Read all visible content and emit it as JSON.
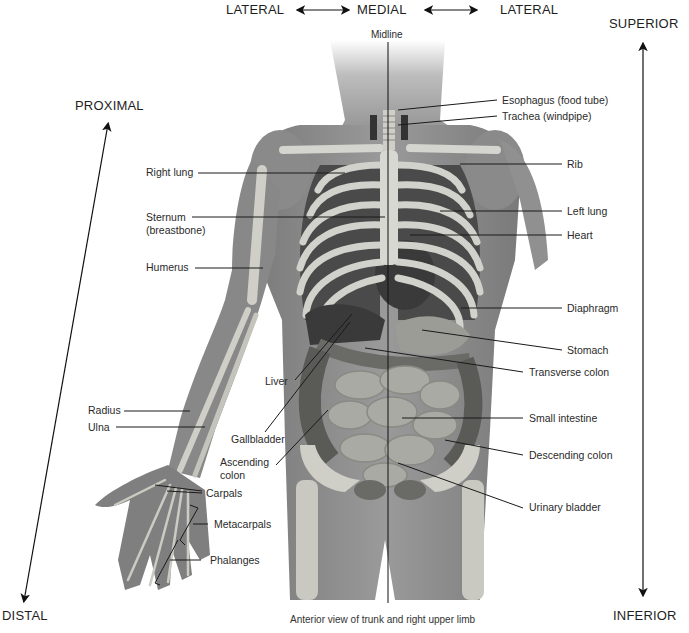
{
  "figure": {
    "caption": "Anterior view of trunk and right upper limb",
    "midline_label": "Midline",
    "colors": {
      "background": "#ffffff",
      "skin": "#8c8c8c",
      "skin_dark": "#6e6e6e",
      "bone": "#d2d2cc",
      "organ_dark": "#3f3f3f",
      "intestine": "#a9a9a4",
      "leader_line": "#1a1a1a"
    }
  },
  "directions": {
    "top_left": "LATERAL",
    "top_center": "MEDIAL",
    "top_right": "LATERAL",
    "superior": "SUPERIOR",
    "inferior": "INFERIOR",
    "proximal": "PROXIMAL",
    "distal": "DISTAL"
  },
  "labels": {
    "left": [
      {
        "id": "right-lung",
        "text": "Right lung"
      },
      {
        "id": "sternum",
        "text": "Sternum"
      },
      {
        "id": "sternum-sub",
        "text": "(breastbone)"
      },
      {
        "id": "humerus",
        "text": "Humerus"
      },
      {
        "id": "liver",
        "text": "Liver"
      },
      {
        "id": "radius",
        "text": "Radius"
      },
      {
        "id": "ulna",
        "text": "Ulna"
      },
      {
        "id": "gallbladder",
        "text": "Gallbladder"
      },
      {
        "id": "ascending-colon",
        "text": "Ascending"
      },
      {
        "id": "ascending-colon-sub",
        "text": "colon"
      },
      {
        "id": "carpals",
        "text": "Carpals"
      },
      {
        "id": "metacarpals",
        "text": "Metacarpals"
      },
      {
        "id": "phalanges",
        "text": "Phalanges"
      }
    ],
    "right": [
      {
        "id": "esophagus",
        "text": "Esophagus (food tube)"
      },
      {
        "id": "trachea",
        "text": "Trachea (windpipe)"
      },
      {
        "id": "rib",
        "text": "Rib"
      },
      {
        "id": "left-lung",
        "text": "Left lung"
      },
      {
        "id": "heart",
        "text": "Heart"
      },
      {
        "id": "diaphragm",
        "text": "Diaphragm"
      },
      {
        "id": "stomach",
        "text": "Stomach"
      },
      {
        "id": "transverse-colon",
        "text": "Transverse colon"
      },
      {
        "id": "small-intestine",
        "text": "Small intestine"
      },
      {
        "id": "descending-colon",
        "text": "Descending colon"
      },
      {
        "id": "urinary-bladder",
        "text": "Urinary bladder"
      }
    ]
  }
}
